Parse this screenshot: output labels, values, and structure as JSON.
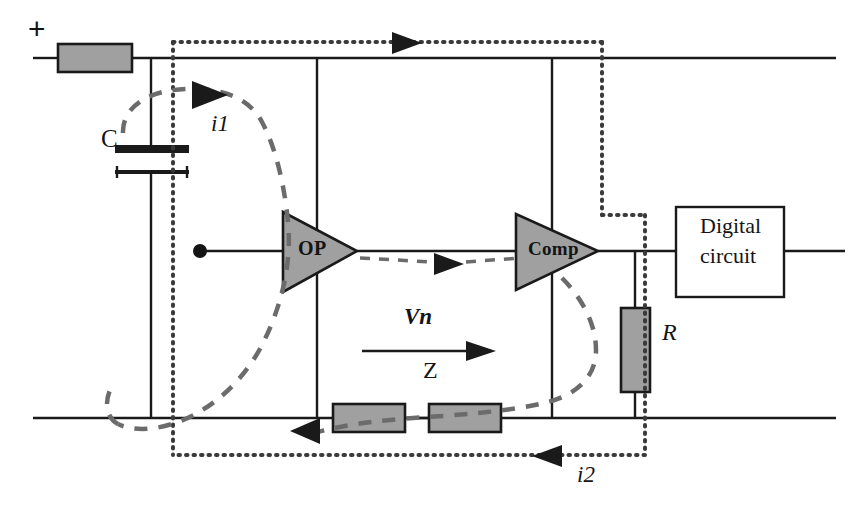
{
  "figure": {
    "colors": {
      "wire": "#1a1a1a",
      "component_fill": "#a0a0a0",
      "component_stroke": "#1a1a1a",
      "dotted_loop": "#3a3a3a",
      "dashed_current": "#6b6b6b",
      "background": "#ffffff",
      "text": "#141414"
    }
  },
  "labels": {
    "supply_plus": "+",
    "capacitor": "C",
    "current_i1": "i1",
    "current_i2": "i2",
    "voltage_vn": "Vn",
    "impedance_z": "Z",
    "resistor_r": "R",
    "op_amp": "OP",
    "comparator": "Comp",
    "digital_block_line1": "Digital",
    "digital_block_line2": "circuit"
  },
  "components": [
    {
      "id": "series-resistor-top",
      "type": "resistor",
      "orientation": "horizontal",
      "label": ""
    },
    {
      "id": "capacitor-c",
      "type": "capacitor",
      "orientation": "horizontal-plates",
      "label": "C"
    },
    {
      "id": "op-amp",
      "type": "triangle-amplifier",
      "label": "OP"
    },
    {
      "id": "comparator",
      "type": "triangle-amplifier",
      "label": "Comp"
    },
    {
      "id": "digital-circuit",
      "type": "block",
      "label": "Digital circuit"
    },
    {
      "id": "impedance-z-a",
      "type": "resistor",
      "orientation": "horizontal",
      "label": "Z"
    },
    {
      "id": "impedance-z-b",
      "type": "resistor",
      "orientation": "horizontal",
      "label": "Z"
    },
    {
      "id": "load-resistor-r",
      "type": "resistor",
      "orientation": "vertical",
      "label": "R"
    }
  ],
  "annotations": {
    "dotted_loop_name": "noise current return loop",
    "dashed_loop_i1_name": "i1 current path",
    "dashed_loop_i2_name": "i2 current path",
    "arrows": [
      {
        "name": "dotted-top-arrow",
        "direction": "right"
      },
      {
        "name": "dotted-bottom-arrow",
        "direction": "left"
      },
      {
        "name": "i1-arrow",
        "direction": "right"
      },
      {
        "name": "i2-arrow-left",
        "direction": "left"
      },
      {
        "name": "vn-arrow",
        "direction": "right"
      },
      {
        "name": "op-output-arrow",
        "direction": "right"
      }
    ]
  }
}
